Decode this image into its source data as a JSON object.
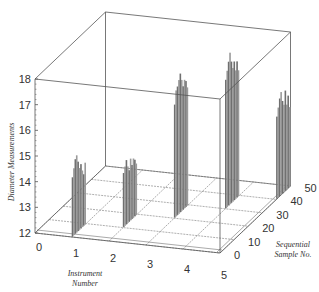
{
  "chart_data": {
    "type": "bar3d",
    "title": "",
    "xlabel": "Instrument Number",
    "ylabel": "Sequential Sample No.",
    "zlabel": "Diameter Measurements",
    "x_ticks": [
      "0",
      "1",
      "2",
      "3",
      "4",
      "5"
    ],
    "y_ticks": [
      "0",
      "10",
      "20",
      "30",
      "40",
      "50"
    ],
    "z_ticks": [
      "12",
      "13",
      "14",
      "15",
      "16",
      "17",
      "18"
    ],
    "xlim": [
      0,
      5
    ],
    "ylim": [
      0,
      50
    ],
    "zlim": [
      12,
      18
    ],
    "grid": true,
    "series": [
      {
        "name": "Instrument 1",
        "x": 1,
        "samples": [
          1,
          2,
          3,
          4,
          5,
          6,
          7,
          8,
          9,
          10
        ],
        "values": [
          14.3,
          14.6,
          14.9,
          15.0,
          14.7,
          14.4,
          14.5,
          14.2,
          14.0,
          14.4
        ]
      },
      {
        "name": "Instrument 2",
        "x": 2,
        "samples": [
          11,
          12,
          13,
          14,
          15,
          16,
          17,
          18,
          19,
          20
        ],
        "values": [
          14.1,
          14.3,
          14.5,
          14.2,
          14.0,
          14.4,
          14.1,
          14.3,
          14.2,
          14.0
        ]
      },
      {
        "name": "Instrument 3",
        "x": 3,
        "samples": [
          21,
          22,
          23,
          24,
          25,
          26,
          27,
          28,
          29,
          30
        ],
        "values": [
          16.4,
          16.9,
          17.0,
          17.2,
          17.4,
          17.1,
          16.8,
          17.0,
          16.9,
          16.6
        ]
      },
      {
        "name": "Instrument 4",
        "x": 4,
        "samples": [
          31,
          32,
          33,
          34,
          35,
          36,
          37,
          38,
          39,
          40
        ],
        "values": [
          17.0,
          17.3,
          17.6,
          17.9,
          17.5,
          17.2,
          17.4,
          17.0,
          17.3,
          16.9
        ]
      },
      {
        "name": "Instrument 5",
        "x": 5,
        "samples": [
          41,
          42,
          43,
          44,
          45,
          46,
          47,
          48,
          49,
          50
        ],
        "values": [
          15.2,
          15.5,
          15.8,
          16.0,
          15.6,
          15.4,
          15.9,
          15.3,
          15.6,
          15.1
        ]
      }
    ]
  },
  "colors": {
    "line": "#555555",
    "grid": "#777777",
    "bar": "#9a9a9a",
    "bar_dark": "#6f6f6f"
  }
}
